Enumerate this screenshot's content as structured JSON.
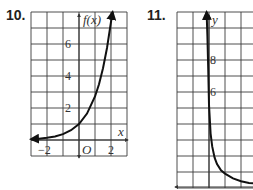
{
  "chart_data": [
    {
      "type": "line",
      "number": "10.",
      "title": "",
      "xlabel": "x",
      "ylabel": "f(x)",
      "origin_label": "O",
      "xlim": [
        -3,
        3
      ],
      "ylim": [
        -1,
        8
      ],
      "grid": true,
      "x_tick_labels": [
        {
          "value": -2,
          "label": "−2"
        },
        {
          "value": 2,
          "label": "2"
        }
      ],
      "y_tick_labels": [
        {
          "value": 2,
          "label": "2"
        },
        {
          "value": 4,
          "label": "4"
        },
        {
          "value": 6,
          "label": "6"
        }
      ],
      "series": [
        {
          "name": "f(x)",
          "x": [
            -3,
            -2.5,
            -2,
            -1.5,
            -1,
            -0.5,
            0,
            0.5,
            1,
            1.25,
            1.5,
            1.75,
            2,
            2.1
          ],
          "y": [
            0.05,
            0.08,
            0.14,
            0.22,
            0.37,
            0.61,
            1.0,
            1.65,
            2.72,
            3.49,
            4.48,
            5.75,
            7.39,
            8.0
          ],
          "arrow_left": true,
          "arrow_right": true
        }
      ]
    },
    {
      "type": "line",
      "number": "11.",
      "title": "",
      "xlabel": "",
      "ylabel": "y",
      "xlim": [
        -2,
        3
      ],
      "ylim": [
        0,
        11
      ],
      "grid": true,
      "x_tick_labels": [],
      "y_tick_labels": [
        {
          "value": 6,
          "label": "6"
        },
        {
          "value": 8,
          "label": "8"
        }
      ],
      "series": [
        {
          "name": "y",
          "x": [
            -0.15,
            -0.1,
            -0.05,
            0,
            0.1,
            0.2,
            0.35,
            0.5,
            0.75,
            1,
            1.5,
            2,
            2.5,
            3
          ],
          "y": [
            11,
            9.5,
            7.5,
            5.2,
            3.4,
            2.6,
            1.9,
            1.5,
            1.1,
            0.9,
            0.6,
            0.42,
            0.32,
            0.28
          ],
          "arrow_left": true,
          "arrow_right": false
        }
      ]
    }
  ]
}
